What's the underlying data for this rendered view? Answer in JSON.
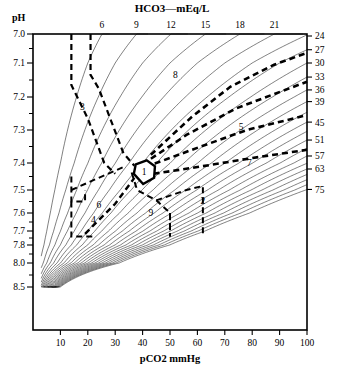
{
  "chart_data": {
    "type": "line",
    "title": "HCO3—mEq/L",
    "xlabel": "pCO2   mmHg",
    "ylabel": "pH",
    "xlim": [
      0,
      100
    ],
    "grid": false,
    "legend_position": "none",
    "x_ticks": [
      10,
      20,
      30,
      40,
      50,
      60,
      70,
      80,
      90,
      100
    ],
    "y_ticks": [
      "7.0",
      "7.1",
      "7.2",
      "7.3",
      "7.4",
      "7.5",
      "7.6",
      "7.7",
      "7.8",
      "8.0",
      "8.5"
    ],
    "top_axis_label": "HCO3—mEq/L",
    "top_ticks": [
      6,
      9,
      12,
      15,
      18,
      21
    ],
    "right_ticks": [
      24,
      27,
      30,
      33,
      36,
      39,
      45,
      51,
      57,
      63,
      75
    ],
    "hco3_isolines": [
      6,
      9,
      12,
      15,
      18,
      21,
      24,
      27,
      30,
      33,
      36,
      39,
      42,
      45,
      48,
      51,
      54,
      57,
      60,
      63,
      66,
      69,
      72,
      75
    ],
    "zones": [
      {
        "id": "1",
        "label": "1",
        "x": 40,
        "note": "normal — solid hexagon"
      },
      {
        "id": "2",
        "label": "2",
        "x": 62
      },
      {
        "id": "3",
        "label": "3",
        "x": 18
      },
      {
        "id": "4",
        "label": "4",
        "x": 22
      },
      {
        "id": "5",
        "label": "5",
        "x": 76
      },
      {
        "id": "6",
        "label": "6",
        "x": 24
      },
      {
        "id": "7",
        "label": "7",
        "x": 79
      },
      {
        "id": "8",
        "label": "8",
        "x": 52
      },
      {
        "id": "9",
        "label": "9",
        "x": 43
      }
    ],
    "colors": {
      "ink": "#000000",
      "background": "#ffffff"
    }
  },
  "axes": {
    "ph_label": "pH",
    "x_axis_title": "pCO2   mmHg",
    "top_title": "HCO3—mEq/L",
    "y_tick_labels": [
      "7.0",
      "7.1",
      "7.2",
      "7.3",
      "7.4",
      "7.5",
      "7.6",
      "7.7",
      "7.8",
      "8.0",
      "8.5"
    ],
    "x_tick_labels": [
      "10",
      "20",
      "30",
      "40",
      "50",
      "60",
      "70",
      "80",
      "90",
      "100"
    ],
    "top_tick_labels": [
      "6",
      "9",
      "12",
      "15",
      "18",
      "21"
    ],
    "right_tick_labels": [
      "24",
      "27",
      "30",
      "33",
      "36",
      "39",
      "45",
      "51",
      "57",
      "63",
      "75"
    ]
  },
  "zone_labels": [
    "1",
    "2",
    "3",
    "4",
    "5",
    "6",
    "7",
    "8",
    "9"
  ]
}
